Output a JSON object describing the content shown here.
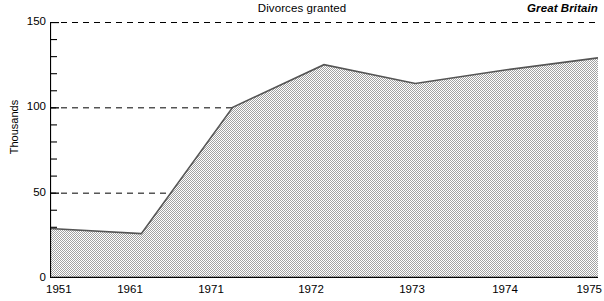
{
  "header": {
    "title": "Divorces granted",
    "region": "Great Britain"
  },
  "axes": {
    "y_title": "Thousands",
    "y_labels": [
      "150",
      "100",
      "50",
      "0"
    ],
    "x_labels": [
      "1951",
      "1961",
      "1971",
      "1972",
      "1973",
      "1974",
      "1975"
    ]
  },
  "colors": {
    "area_fill": "#c9c9c9",
    "line": "#555555",
    "axis": "#000000",
    "gridline": "#000000"
  },
  "chart_data": {
    "type": "area",
    "title": "Divorces granted",
    "subtitle": "Great Britain",
    "xlabel": "",
    "ylabel": "Thousands",
    "categories": [
      "1951",
      "1961",
      "1971",
      "1972",
      "1973",
      "1974",
      "1975"
    ],
    "values": [
      29,
      26,
      100,
      125,
      114,
      122,
      129
    ],
    "ylim": [
      0,
      150
    ],
    "yticks_major": [
      0,
      50,
      100,
      150
    ],
    "yticks_minor_step": 10,
    "grid": "horizontal-dashed-at-major-ticks",
    "legend": "none"
  }
}
